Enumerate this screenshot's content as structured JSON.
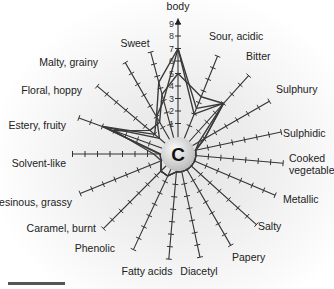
{
  "chart_data": {
    "type": "radar",
    "title": "",
    "center_label": "C",
    "scale": {
      "min": 0,
      "max": 9,
      "ticks": [
        1,
        2,
        3,
        4,
        5,
        6,
        7,
        8,
        9
      ],
      "labeled_axis": "body"
    },
    "axes": [
      "body",
      "Sour, acidic",
      "Bitter",
      "Sulphury",
      "Sulphidic",
      "Cooked vegetable",
      "Metallic",
      "Salty",
      "Papery",
      "Diacetyl",
      "Fatty acids",
      "Phenolic",
      "Caramel, burnt",
      "Resinous, grassy",
      "Solvent-like",
      "Estery, fruity",
      "Floral, hoppy",
      "Malty, grainy",
      "Sweet"
    ],
    "series": [
      {
        "name": "Sample 1",
        "values": [
          7,
          2.5,
          4,
          0.5,
          0,
          0,
          0,
          0,
          0,
          0,
          0,
          0.5,
          0.5,
          0,
          0,
          5,
          1,
          2,
          3
        ]
      },
      {
        "name": "Sample 2",
        "values": [
          5,
          3.5,
          4,
          1,
          0,
          0,
          0,
          0,
          0,
          0,
          0,
          0.5,
          0.5,
          0,
          0.5,
          4,
          1.5,
          1.5,
          3.5
        ]
      },
      {
        "name": "Sample 3",
        "values": [
          7,
          2,
          4,
          1,
          0,
          0,
          0,
          0,
          0,
          0,
          0,
          0.5,
          0.5,
          0,
          0,
          5,
          0.5,
          2,
          4.5
        ]
      }
    ],
    "grid": false,
    "legend": "none"
  },
  "colors": {
    "line": "#333333",
    "center_fill": "#d8d8d8"
  }
}
